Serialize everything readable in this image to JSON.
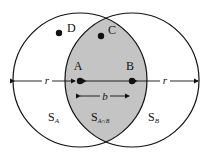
{
  "diagram": {
    "points": {
      "A": "A",
      "B": "B",
      "C": "C",
      "D": "D"
    },
    "labels": {
      "r_left": "r",
      "r_right": "r",
      "b": "b",
      "S_A_main": "S",
      "S_A_sub": "A",
      "S_B_main": "S",
      "S_B_sub": "B",
      "S_AnB_main": "S",
      "S_AnB_sub": "A∩B"
    },
    "colors": {
      "intersection_fill": "#c4c4c4",
      "stroke": "#111111",
      "background": "#ffffff"
    }
  }
}
